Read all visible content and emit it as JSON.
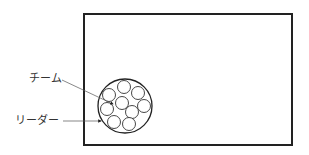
{
  "diagram": {
    "frame": {
      "x": 84,
      "y": 14,
      "width": 208,
      "height": 131,
      "stroke": "#222222",
      "stroke_width": 2
    },
    "team_circle": {
      "cx": 125,
      "cy": 106,
      "r": 27,
      "stroke": "#222222"
    },
    "member_circles": [
      {
        "cx": 124,
        "cy": 87,
        "r": 6.5
      },
      {
        "cx": 109,
        "cy": 95,
        "r": 6.5
      },
      {
        "cx": 138,
        "cy": 93,
        "r": 6.5
      },
      {
        "cx": 122,
        "cy": 103,
        "r": 6.5
      },
      {
        "cx": 144,
        "cy": 106,
        "r": 6.5
      },
      {
        "cx": 107,
        "cy": 109,
        "r": 6.5
      },
      {
        "cx": 132,
        "cy": 112,
        "r": 6.5
      },
      {
        "cx": 114,
        "cy": 122,
        "r": 6.5
      },
      {
        "cx": 129,
        "cy": 124,
        "r": 6.5
      }
    ],
    "labels": {
      "team": "チーム",
      "leader": "リーダー"
    },
    "leader_lines": {
      "team": {
        "x1": 62,
        "y1": 80,
        "x2": 113,
        "y2": 104
      },
      "leader": {
        "x1": 63,
        "y1": 121,
        "x2": 101,
        "y2": 121
      }
    }
  }
}
